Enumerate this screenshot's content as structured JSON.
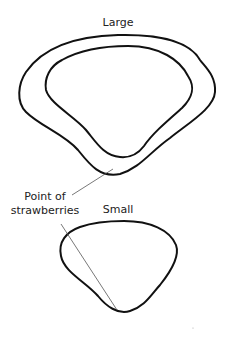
{
  "diagram": {
    "labels": {
      "large": "Large",
      "small": "Small",
      "pointer_line1": "Point of",
      "pointer_line2": "strawberries"
    },
    "shapes": [
      {
        "name": "large-outer-outline"
      },
      {
        "name": "large-inner-outline"
      },
      {
        "name": "small-outline"
      }
    ],
    "colors": {
      "outline": "#111111",
      "pointer": "#555555",
      "background": "#ffffff"
    }
  }
}
